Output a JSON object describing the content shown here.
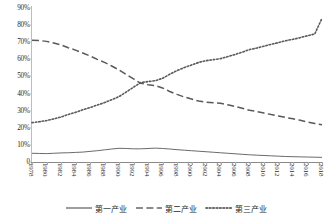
{
  "chart_data": {
    "type": "line",
    "title": "",
    "xlabel": "",
    "ylabel": "",
    "ylim": [
      0,
      90
    ],
    "ytick_labels": [
      "0",
      "10%",
      "20%",
      "30%",
      "40%",
      "50%",
      "60%",
      "70%",
      "80%",
      "90%"
    ],
    "ytick_values": [
      0,
      10,
      20,
      30,
      40,
      50,
      60,
      70,
      80,
      90
    ],
    "grid": false,
    "legend_position": "bottom",
    "x": [
      1978,
      1979,
      1980,
      1981,
      1982,
      1983,
      1984,
      1985,
      1986,
      1987,
      1988,
      1989,
      1990,
      1991,
      1992,
      1993,
      1994,
      1995,
      1996,
      1997,
      1998,
      1999,
      2000,
      2001,
      2002,
      2003,
      2004,
      2005,
      2006,
      2007,
      2008,
      2009,
      2010,
      2011,
      2012,
      2013,
      2014,
      2015,
      2016,
      2017,
      2018
    ],
    "xtick_labels": [
      "1978",
      "1980",
      "1982",
      "1984",
      "1986",
      "1988",
      "1990",
      "1992",
      "1994",
      "1996",
      "1998",
      "2000",
      "2002",
      "2004",
      "2006",
      "2008",
      "2010",
      "2012",
      "2014",
      "2016",
      "2018"
    ],
    "series": [
      {
        "name": "第一产业",
        "style": "solid",
        "color": "#4d4d4d",
        "values": [
          5.1,
          5.0,
          4.9,
          5.1,
          5.3,
          5.4,
          5.6,
          5.8,
          6.2,
          6.6,
          7.1,
          7.6,
          8.0,
          7.9,
          7.7,
          7.7,
          7.9,
          8.1,
          7.9,
          7.6,
          7.2,
          6.9,
          6.6,
          6.3,
          6.0,
          5.7,
          5.4,
          5.1,
          4.8,
          4.5,
          4.2,
          4.0,
          3.8,
          3.6,
          3.4,
          3.2,
          3.1,
          3.0,
          2.9,
          2.8,
          2.7
        ]
      },
      {
        "name": "第二产业",
        "style": "dashed",
        "color": "#666666",
        "values": [
          71.2,
          71.0,
          70.5,
          69.6,
          68.4,
          66.8,
          65.4,
          63.7,
          62.0,
          60.0,
          58.2,
          56.1,
          53.8,
          51.2,
          48.6,
          46.0,
          45.2,
          44.6,
          43.3,
          41.2,
          39.5,
          38.0,
          36.8,
          35.6,
          34.9,
          34.6,
          34.3,
          33.4,
          32.5,
          31.4,
          30.2,
          29.5,
          28.6,
          27.7,
          26.9,
          26.0,
          25.3,
          24.4,
          23.4,
          22.5,
          21.8
        ]
      },
      {
        "name": "第三产业",
        "style": "dotted",
        "color": "#707070",
        "values": [
          23.0,
          23.5,
          24.2,
          25.2,
          26.3,
          27.8,
          29.0,
          30.5,
          31.8,
          33.3,
          34.7,
          36.4,
          38.2,
          40.9,
          43.7,
          46.4,
          47.0,
          47.5,
          48.9,
          51.3,
          53.4,
          55.2,
          56.7,
          58.2,
          59.2,
          59.8,
          60.4,
          61.6,
          62.8,
          64.2,
          65.7,
          66.6,
          67.7,
          68.8,
          69.8,
          70.9,
          71.7,
          72.7,
          73.8,
          74.8,
          84.0
        ]
      }
    ]
  },
  "legend": {
    "items": [
      {
        "label": "第一产业",
        "style": "solid"
      },
      {
        "label": "第二产业",
        "style": "dashed"
      },
      {
        "label": "第三产业",
        "style": "dotted"
      }
    ]
  }
}
